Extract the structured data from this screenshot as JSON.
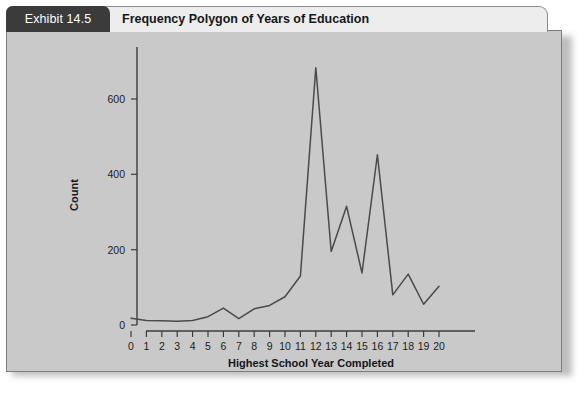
{
  "exhibit": {
    "tab_label": "Exhibit 14.5",
    "title": "Frequency Polygon of Years of Education"
  },
  "colors": {
    "tab_background": "#3b3b3b",
    "tab_text": "#ffffff",
    "header_background": "#ededed",
    "panel_background": "#c9c9c9",
    "panel_border": "#7e7e7e",
    "line": "#4a4a4a",
    "axis": "#3c3c3c",
    "text": "#15171a"
  },
  "chart_data": {
    "type": "line",
    "title": "Frequency Polygon of Years of Education",
    "xlabel": "Highest School Year Completed",
    "ylabel": "Count",
    "x": [
      0,
      1,
      2,
      3,
      4,
      5,
      6,
      7,
      8,
      9,
      10,
      11,
      12,
      13,
      14,
      15,
      16,
      17,
      18,
      19,
      20
    ],
    "values": [
      18,
      12,
      11,
      10,
      12,
      22,
      45,
      17,
      43,
      52,
      75,
      130,
      683,
      195,
      315,
      138,
      452,
      80,
      135,
      55,
      103
    ],
    "xticklabels": [
      "0",
      "1",
      "2",
      "3",
      "4",
      "5",
      "6",
      "7",
      "8",
      "9",
      "10",
      "11",
      "12",
      "13",
      "14",
      "15",
      "16",
      "17",
      "18",
      "19",
      "20"
    ],
    "yticks": [
      0,
      200,
      400,
      600
    ],
    "yticklabels": [
      "0",
      "200",
      "400",
      "600"
    ],
    "xlim": [
      -0.6,
      20.6
    ],
    "ylim": [
      0,
      720
    ],
    "grid": false,
    "legend": false,
    "legend_position": "none"
  }
}
